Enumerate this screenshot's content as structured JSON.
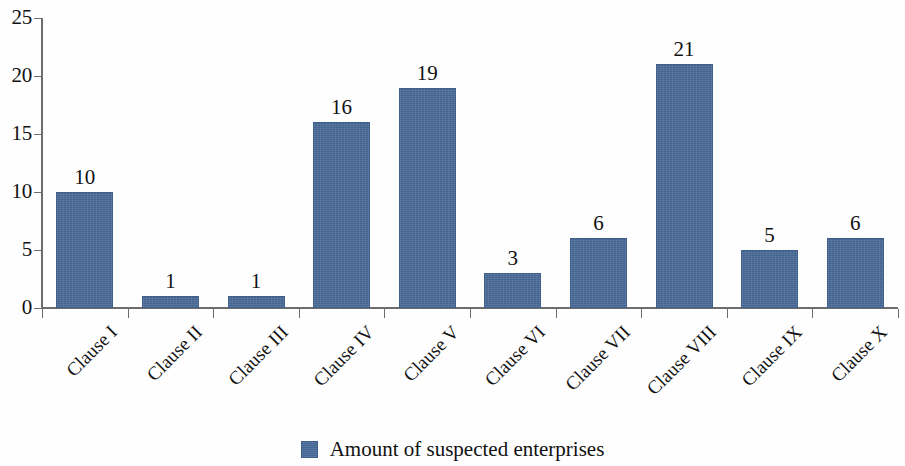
{
  "chart_data": {
    "type": "bar",
    "title": "",
    "subtitle": "",
    "xlabel": "",
    "ylabel": "",
    "categories": [
      "Clause I",
      "Clause II",
      "Clause III",
      "Clause IV",
      "Clause V",
      "Clause VI",
      "Clause VII",
      "Clause VIII",
      "Clause IX",
      "Clause X"
    ],
    "values": [
      10,
      1,
      1,
      16,
      19,
      3,
      6,
      21,
      5,
      6
    ],
    "series": [
      {
        "name": "Amount of suspected enterprises",
        "values": [
          10,
          1,
          1,
          16,
          19,
          3,
          6,
          21,
          5,
          6
        ],
        "color": "#4a6b9a"
      }
    ],
    "data_labels": [
      "10",
      "1",
      "1",
      "16",
      "19",
      "3",
      "6",
      "21",
      "5",
      "6"
    ],
    "ylim": [
      0,
      25
    ],
    "y_ticks": [
      0,
      5,
      10,
      15,
      20,
      25
    ],
    "y_tick_labels": [
      "0",
      "5",
      "10",
      "15",
      "20",
      "25"
    ],
    "grid": false,
    "legend_position": "bottom-center",
    "x_tick_label_rotation": -45
  },
  "legend": {
    "entries": [
      {
        "label": "Amount of suspected enterprises",
        "color": "#4a6b9a"
      }
    ]
  },
  "colors": {
    "bar": "#4a6b9a",
    "bar_border": "#3f5f8c",
    "axis": "#6d6d6d",
    "text": "#111111",
    "background": "#fefefe"
  }
}
